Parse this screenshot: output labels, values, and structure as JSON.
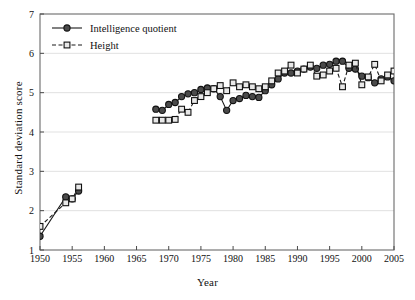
{
  "chart_data": {
    "type": "line",
    "title": "",
    "xlabel": "Year",
    "ylabel": "Standard deviation score",
    "xlim": [
      1950,
      2005
    ],
    "ylim": [
      1,
      7
    ],
    "xticks": [
      1950,
      1955,
      1960,
      1965,
      1970,
      1975,
      1980,
      1985,
      1990,
      1995,
      2000,
      2005
    ],
    "yticks": [
      1,
      2,
      3,
      4,
      5,
      6,
      7
    ],
    "grid": "horizontal",
    "legend_position": "top-left",
    "series": [
      {
        "name": "Intelligence quotient",
        "marker": "filled-circle",
        "line": "solid",
        "color": "#1a1a1a",
        "x": [
          1950,
          1954,
          1955,
          1956,
          1968,
          1969,
          1970,
          1971,
          1972,
          1973,
          1974,
          1975,
          1976,
          1977,
          1978,
          1979,
          1980,
          1981,
          1982,
          1983,
          1984,
          1985,
          1986,
          1987,
          1988,
          1989,
          1990,
          1991,
          1992,
          1993,
          1994,
          1995,
          1996,
          1997,
          1998,
          1999,
          2000,
          2001,
          2002,
          2003,
          2004,
          2005
        ],
        "y": [
          1.35,
          2.35,
          2.3,
          2.5,
          4.58,
          4.55,
          4.7,
          4.75,
          4.9,
          4.97,
          5.0,
          5.08,
          5.12,
          5.1,
          4.9,
          4.55,
          4.8,
          4.85,
          4.93,
          4.9,
          4.88,
          5.05,
          5.2,
          5.35,
          5.5,
          5.5,
          5.55,
          5.6,
          5.65,
          5.62,
          5.7,
          5.72,
          5.8,
          5.8,
          5.62,
          5.6,
          5.42,
          5.38,
          5.25,
          5.35,
          5.4,
          5.3
        ]
      },
      {
        "name": "Height",
        "marker": "open-square",
        "line": "dashed",
        "color": "#1a1a1a",
        "x": [
          1950,
          1954,
          1955,
          1956,
          1968,
          1969,
          1970,
          1971,
          1972,
          1973,
          1974,
          1975,
          1976,
          1977,
          1978,
          1979,
          1980,
          1981,
          1982,
          1983,
          1984,
          1985,
          1986,
          1987,
          1988,
          1989,
          1990,
          1991,
          1992,
          1993,
          1994,
          1995,
          1996,
          1997,
          1998,
          1999,
          2000,
          2001,
          2002,
          2003,
          2004,
          2005
        ],
        "y": [
          1.6,
          2.2,
          2.3,
          2.6,
          4.3,
          4.3,
          4.3,
          4.32,
          4.58,
          4.5,
          4.8,
          4.9,
          5.0,
          5.1,
          5.18,
          5.05,
          5.25,
          5.15,
          5.2,
          5.15,
          5.1,
          5.15,
          5.3,
          5.5,
          5.55,
          5.7,
          5.5,
          5.6,
          5.7,
          5.42,
          5.45,
          5.55,
          5.62,
          5.15,
          5.7,
          5.75,
          5.2,
          5.4,
          5.72,
          5.3,
          5.45,
          5.55
        ]
      }
    ],
    "legend": [
      {
        "label": "Intelligence quotient",
        "marker": "filled-circle",
        "line": "solid"
      },
      {
        "label": "Height",
        "marker": "open-square",
        "line": "dashed"
      }
    ]
  },
  "axes": {
    "x_title": "Year",
    "y_title": "Standard deviation score"
  }
}
